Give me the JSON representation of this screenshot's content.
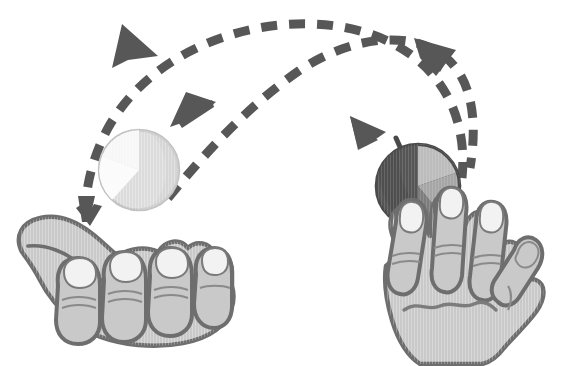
{
  "scene": {
    "title": "Two-hand ball toss illustration",
    "description": "Grayscale line illustration of two hands exchanging two balls along crossing dashed arc trajectories",
    "width": 577,
    "height": 366,
    "background_color": "#ffffff"
  },
  "palette": {
    "background": "#ffffff",
    "stroke_dark": "#555555",
    "arrow_dark": "#575757",
    "hand_fill": "#c9c9c9",
    "hand_fill_shadow": "#bdbdbd",
    "hand_outline": "#6e6e6e",
    "nail_fill": "#f2f2f2",
    "nail_outline": "#7a7a7a",
    "crease_line": "#8a8a8a",
    "ball_light_body": "#dcdcdc",
    "ball_light_wedge": "#f6f6f6",
    "ball_light_outline": "#c2c2c2",
    "ball_dark_body": "#555555",
    "ball_dark_wedge": "#b9b9b9",
    "ball_dark_wedge_2": "#8d8d8d",
    "ball_dark_outline": "#4a4a4a"
  },
  "objects": {
    "left_hand": {
      "label": "Left hand, palm up, fingers curled, catching position",
      "orientation": "palm-up-curled",
      "finger_count": 4,
      "thumb_visible": true,
      "center_x": 118,
      "center_y": 283
    },
    "right_hand": {
      "label": "Right hand, palm forward, fingers splayed open, throwing position",
      "orientation": "palm-forward-splayed",
      "finger_count": 4,
      "thumb_visible": true,
      "center_x": 460,
      "center_y": 275
    },
    "ball_light": {
      "label": "Light ball in flight above left hand",
      "shade": "light",
      "center_x": 139,
      "center_y": 170,
      "radius": 40,
      "wedge_visible": true
    },
    "ball_dark": {
      "label": "Dark ball held in right hand",
      "shade": "dark",
      "center_x": 418,
      "center_y": 186,
      "radius": 42,
      "wedge_visible": true
    }
  },
  "trajectories": [
    {
      "id": "arc-right-to-left",
      "label": "Dashed arc from right hand to left hand",
      "direction": "right-to-left",
      "arrowheads": 3,
      "dash_pattern": "16 12",
      "stroke_width": 9
    },
    {
      "id": "arc-left-to-right",
      "label": "Dashed arc from left hand to right hand",
      "direction": "left-to-right",
      "arrowheads": 2,
      "dash_pattern": "16 12",
      "stroke_width": 9
    }
  ],
  "arrowheads": [
    {
      "id": "arrow-top-left",
      "label": "Large arrowhead at top left pointing up-right",
      "x": 130,
      "y": 45,
      "direction": "up-right",
      "size": "large"
    },
    {
      "id": "arrow-mid-left",
      "label": "Arrowhead mid-left pointing up-right",
      "x": 196,
      "y": 108,
      "direction": "up-right",
      "size": "medium"
    },
    {
      "id": "arrow-top-right",
      "label": "Arrowhead at top right pointing down-right",
      "x": 434,
      "y": 55,
      "direction": "down-right",
      "size": "large"
    },
    {
      "id": "arrow-mid-right",
      "label": "Arrowhead mid-right pointing up-left",
      "x": 362,
      "y": 126,
      "direction": "up-left",
      "size": "medium"
    },
    {
      "id": "arrow-into-palm",
      "label": "Small arrowhead pointing down into left palm",
      "x": 87,
      "y": 216,
      "direction": "down",
      "size": "small"
    }
  ],
  "crossing_point": {
    "label": "Point where the two dashed arcs cross",
    "x": 281,
    "y": 58
  }
}
